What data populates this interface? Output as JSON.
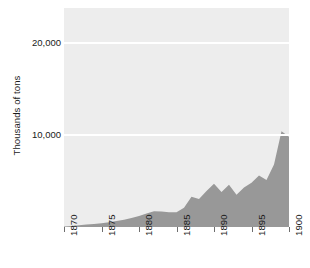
{
  "chart_data": {
    "type": "area",
    "title": "",
    "xlabel": "",
    "ylabel": "Thousands of tons",
    "xlim": [
      1870,
      1900
    ],
    "ylim": [
      0,
      23800
    ],
    "grid": true,
    "legend": "none",
    "yticks": [
      10000,
      20000
    ],
    "ytick_labels": [
      "10,000",
      "20,000"
    ],
    "xticks": [
      1870,
      1875,
      1880,
      1885,
      1890,
      1895,
      1900
    ],
    "xtick_labels": [
      "1870",
      "1875",
      "1880",
      "1885",
      "1890",
      "1895",
      "1900"
    ],
    "x": [
      1870,
      1871,
      1872,
      1873,
      1874,
      1875,
      1876,
      1877,
      1878,
      1879,
      1880,
      1881,
      1882,
      1883,
      1884,
      1885,
      1886,
      1887,
      1888,
      1889,
      1890,
      1891,
      1892,
      1893,
      1894,
      1895,
      1896,
      1897,
      1898,
      1899,
      1900
    ],
    "values": [
      60,
      110,
      180,
      260,
      330,
      420,
      520,
      640,
      790,
      980,
      1200,
      1480,
      1720,
      1680,
      1600,
      1600,
      2100,
      3300,
      3050,
      3900,
      4700,
      3800,
      4600,
      3500,
      4300,
      4800,
      5600,
      5100,
      6800,
      10400,
      9800
    ],
    "series": [
      {
        "name": "Output",
        "values": [
          60,
          110,
          180,
          260,
          330,
          420,
          520,
          640,
          790,
          980,
          1200,
          1480,
          1720,
          1680,
          1600,
          1600,
          2100,
          3300,
          3050,
          3900,
          4700,
          3800,
          4600,
          3500,
          4300,
          4800,
          5600,
          5100,
          6800,
          10400,
          9800
        ]
      }
    ],
    "colors": {
      "area_fill": "#989898",
      "plot_background": "#ededed",
      "gridline": "#ffffff",
      "text": "#1a1a1a",
      "tick_mark": "#6e6e6e",
      "figure_background": "#ffffff"
    }
  }
}
